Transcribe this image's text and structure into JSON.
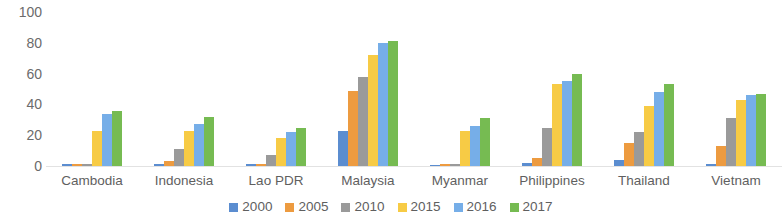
{
  "chart_data": {
    "type": "bar",
    "title": "",
    "xlabel": "",
    "ylabel": "",
    "ylim": [
      0,
      100
    ],
    "yticks": [
      100,
      80,
      60,
      40,
      20,
      0
    ],
    "grid": false,
    "legend_position": "bottom",
    "categories": [
      "Cambodia",
      "Indonesia",
      "Lao PDR",
      "Malaysia",
      "Myanmar",
      "Philippines",
      "Thailand",
      "Vietnam"
    ],
    "series": [
      {
        "name": "2000",
        "color": "#5b8dd0",
        "values": [
          1,
          1,
          1,
          23,
          0,
          2,
          4,
          1
        ]
      },
      {
        "name": "2005",
        "color": "#ed9b40",
        "values": [
          1,
          3,
          1,
          49,
          1,
          5,
          15,
          13
        ]
      },
      {
        "name": "2010",
        "color": "#9a9a9a",
        "values": [
          1,
          11,
          7,
          58,
          1,
          25,
          22,
          31
        ]
      },
      {
        "name": "2015",
        "color": "#f7cb45",
        "values": [
          23,
          23,
          18,
          72,
          23,
          53,
          39,
          43
        ]
      },
      {
        "name": "2016",
        "color": "#76aee8",
        "values": [
          34,
          27,
          22,
          80,
          26,
          55,
          48,
          46
        ]
      },
      {
        "name": "2017",
        "color": "#76bb52",
        "values": [
          36,
          32,
          25,
          81,
          31,
          60,
          53,
          47
        ]
      }
    ]
  }
}
